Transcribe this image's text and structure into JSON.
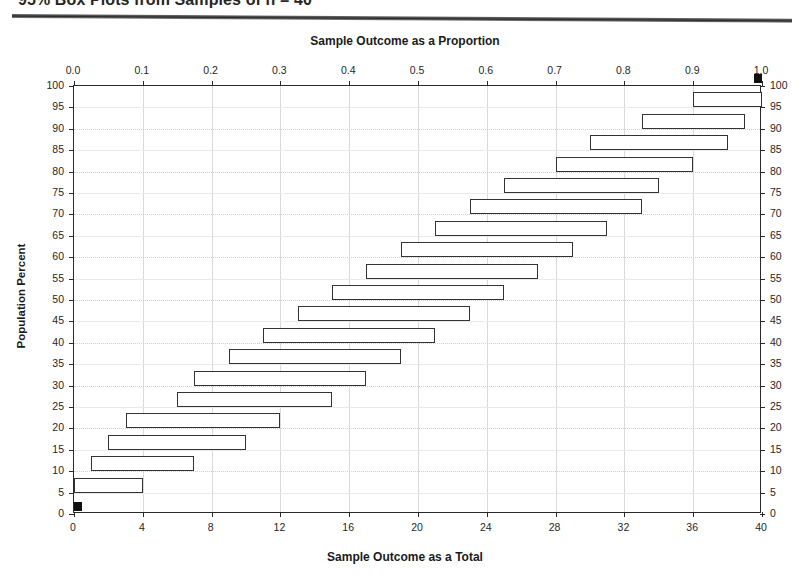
{
  "page": {
    "title": "95% Box Plots from Samples of n = 40",
    "title_truncated": true
  },
  "chart_data": {
    "type": "bar",
    "orientation": "horizontal",
    "title": "95% Box Plots from Samples of n = 40",
    "top_axis_title": "Sample Outcome as a Proportion",
    "bottom_axis_title": "Sample Outcome as a  Total",
    "left_axis_title": "Population Percent",
    "right_axis_title": "",
    "xlabel": "Sample Outcome as a Total",
    "ylabel": "Population Percent",
    "xlim": [
      0,
      40
    ],
    "ylim": [
      0,
      100
    ],
    "grid": true,
    "legend": "none",
    "top_ticks": [
      "0.0",
      "0.1",
      "0.2",
      "0.3",
      "0.4",
      "0.5",
      "0.6",
      "0.7",
      "0.8",
      "0.9",
      "1.0"
    ],
    "top_tick_values": [
      0.0,
      0.1,
      0.2,
      0.3,
      0.4,
      0.5,
      0.6,
      0.7,
      0.8,
      0.9,
      1.0
    ],
    "bottom_ticks": [
      "0",
      "4",
      "8",
      "12",
      "16",
      "20",
      "24",
      "28",
      "32",
      "36",
      "40"
    ],
    "bottom_tick_values": [
      0,
      4,
      8,
      12,
      16,
      20,
      24,
      28,
      32,
      36,
      40
    ],
    "left_ticks": [
      "0",
      "5",
      "10",
      "15",
      "20",
      "25",
      "30",
      "35",
      "40",
      "45",
      "50",
      "55",
      "60",
      "65",
      "70",
      "75",
      "80",
      "85",
      "90",
      "95",
      "100"
    ],
    "left_tick_values": [
      0,
      5,
      10,
      15,
      20,
      25,
      30,
      35,
      40,
      45,
      50,
      55,
      60,
      65,
      70,
      75,
      80,
      85,
      90,
      95,
      100
    ],
    "right_ticks": [
      "0",
      "5",
      "10",
      "15",
      "20",
      "25",
      "30",
      "35",
      "40",
      "45",
      "50",
      "55",
      "60",
      "65",
      "70",
      "75",
      "80",
      "85",
      "90",
      "95",
      "100"
    ],
    "categories": [
      0,
      5,
      10,
      15,
      20,
      25,
      30,
      35,
      40,
      45,
      50,
      55,
      60,
      65,
      70,
      75,
      80,
      85,
      90,
      95,
      100
    ],
    "boxes": [
      {
        "population_percent": 0,
        "low": 0,
        "high": 0,
        "point": true
      },
      {
        "population_percent": 5,
        "low": 0,
        "high": 4,
        "point": false
      },
      {
        "population_percent": 10,
        "low": 1,
        "high": 7,
        "point": false
      },
      {
        "population_percent": 15,
        "low": 2,
        "high": 10,
        "point": false
      },
      {
        "population_percent": 20,
        "low": 3,
        "high": 12,
        "point": false
      },
      {
        "population_percent": 25,
        "low": 6,
        "high": 15,
        "point": false
      },
      {
        "population_percent": 30,
        "low": 7,
        "high": 17,
        "point": false
      },
      {
        "population_percent": 35,
        "low": 9,
        "high": 19,
        "point": false
      },
      {
        "population_percent": 40,
        "low": 11,
        "high": 21,
        "point": false
      },
      {
        "population_percent": 45,
        "low": 13,
        "high": 23,
        "point": false
      },
      {
        "population_percent": 50,
        "low": 15,
        "high": 25,
        "point": false
      },
      {
        "population_percent": 55,
        "low": 17,
        "high": 27,
        "point": false
      },
      {
        "population_percent": 60,
        "low": 19,
        "high": 29,
        "point": false
      },
      {
        "population_percent": 65,
        "low": 21,
        "high": 31,
        "point": false
      },
      {
        "population_percent": 70,
        "low": 23,
        "high": 33,
        "point": false
      },
      {
        "population_percent": 75,
        "low": 25,
        "high": 34,
        "point": false
      },
      {
        "population_percent": 80,
        "low": 28,
        "high": 36,
        "point": false
      },
      {
        "population_percent": 85,
        "low": 30,
        "high": 38,
        "point": false
      },
      {
        "population_percent": 90,
        "low": 33,
        "high": 39,
        "point": false
      },
      {
        "population_percent": 95,
        "low": 36,
        "high": 40,
        "point": false
      },
      {
        "population_percent": 100,
        "low": 40,
        "high": 40,
        "point": true
      }
    ],
    "colors": {
      "box_stroke": "#333333",
      "box_fill": "#ffffff",
      "point_fill": "#111111",
      "axis": "#2a2a2a",
      "grid": "#d9d9d9",
      "background": "#ffffff"
    }
  }
}
